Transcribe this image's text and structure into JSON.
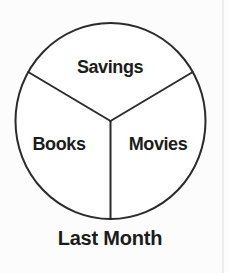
{
  "chart_data": {
    "type": "pie",
    "title": "Last Month",
    "title_position": "below-chart",
    "categories": [
      "Savings",
      "Books",
      "Movies"
    ],
    "values": [
      33.33,
      33.33,
      33.33
    ],
    "slice_angles_deg": [
      120,
      120,
      120
    ],
    "start_boundary_angle_deg": 270,
    "slice_fill_color": "#ffffff",
    "outline_color": "#2b2b2b",
    "text_color": "#1c1c1c",
    "labels_inside_slices": true,
    "legend": "none",
    "numeric_labels_shown": false
  }
}
